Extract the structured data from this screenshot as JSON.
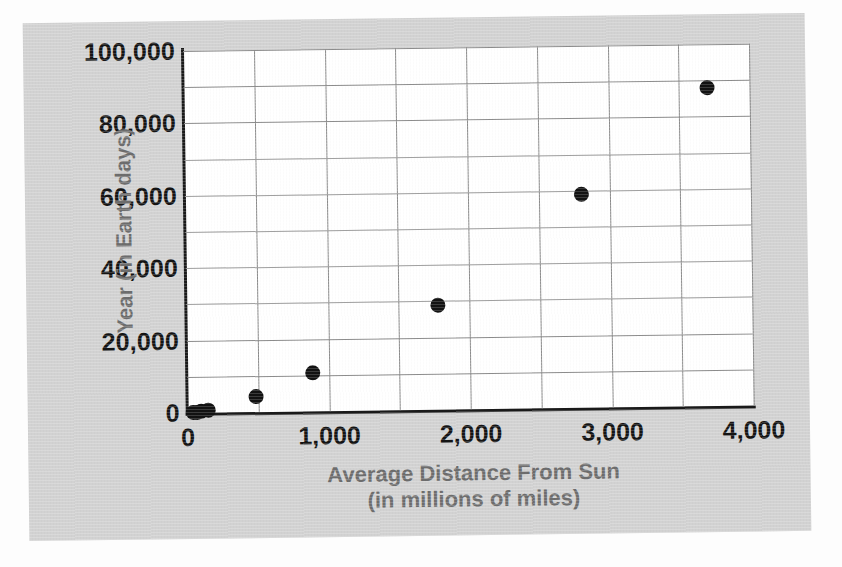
{
  "chart_data": {
    "type": "scatter",
    "title": "",
    "xlabel": "Average Distance From Sun",
    "xlabel_sub": "(in millions of miles)",
    "ylabel": "Year (in Earth days)",
    "xlim": [
      0,
      4000
    ],
    "ylim": [
      0,
      100000
    ],
    "x_tick_labels": [
      "0",
      "1,000",
      "2,000",
      "3,000",
      "4,000"
    ],
    "x_tick_values": [
      0,
      1000,
      2000,
      3000,
      4000
    ],
    "y_tick_labels": [
      "0",
      "20,000",
      "40,000",
      "60,000",
      "80,000",
      "100,000"
    ],
    "y_tick_values": [
      0,
      20000,
      40000,
      60000,
      80000,
      100000
    ],
    "x_gridline_step": 500,
    "y_gridline_step": 10000,
    "grid": true,
    "legend": false,
    "marker": "filled-circle",
    "marker_color": "#121212",
    "points": [
      {
        "x": 36,
        "y": 88
      },
      {
        "x": 67,
        "y": 225
      },
      {
        "x": 93,
        "y": 365
      },
      {
        "x": 142,
        "y": 687
      },
      {
        "x": 484,
        "y": 4333
      },
      {
        "x": 890,
        "y": 10759
      },
      {
        "x": 1780,
        "y": 29000
      },
      {
        "x": 2800,
        "y": 59000
      },
      {
        "x": 3700,
        "y": 88000
      }
    ]
  },
  "colors": {
    "panel_background": "#d2d2d2",
    "plot_background": "#ffffff",
    "axis": "#1a1a1a",
    "gridline": "#8c8c8c",
    "tick_text": "#141414",
    "axis_title_text": "#6d6d6d",
    "marker": "#121212"
  }
}
